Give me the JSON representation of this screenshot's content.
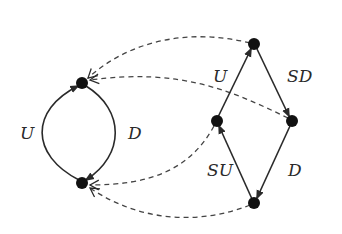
{
  "diagram": {
    "colors": {
      "stroke": "#2a2a2a",
      "node": "#111111",
      "background": "#ffffff"
    },
    "nodes": [
      {
        "id": "A",
        "x": 82,
        "y": 83
      },
      {
        "id": "B",
        "x": 82,
        "y": 183
      },
      {
        "id": "T",
        "x": 254,
        "y": 44
      },
      {
        "id": "L",
        "x": 217,
        "y": 121
      },
      {
        "id": "R",
        "x": 292,
        "y": 121
      },
      {
        "id": "Bo",
        "x": 254,
        "y": 203
      }
    ],
    "solid_edges": [
      {
        "from": "B",
        "to": "A",
        "label": "U"
      },
      {
        "from": "A",
        "to": "B",
        "label": "D"
      },
      {
        "from": "L",
        "to": "T",
        "label": "U"
      },
      {
        "from": "T",
        "to": "R",
        "label": "SD"
      },
      {
        "from": "R",
        "to": "Bo",
        "label": "D"
      },
      {
        "from": "Bo",
        "to": "L",
        "label": "SU"
      }
    ],
    "dashed_edges": [
      {
        "from": "T",
        "to": "A"
      },
      {
        "from": "R",
        "to": "A"
      },
      {
        "from": "L",
        "to": "B"
      },
      {
        "from": "Bo",
        "to": "B"
      }
    ],
    "labels": {
      "left_u": "U",
      "left_d": "D",
      "right_u": "U",
      "right_sd": "SD",
      "right_su": "SU",
      "right_d": "D"
    }
  }
}
